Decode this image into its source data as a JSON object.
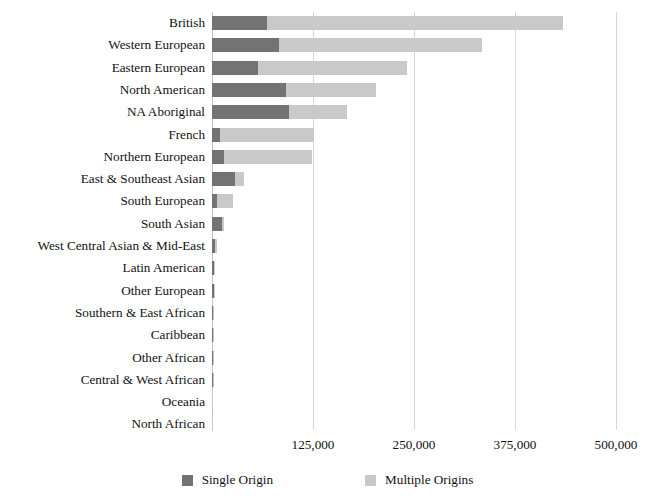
{
  "chart_data": {
    "type": "bar",
    "orientation": "horizontal",
    "stacked": true,
    "title": "",
    "subtitle": "",
    "xlabel": "",
    "ylabel": "",
    "xlim": [
      0,
      500000
    ],
    "xticks": [
      0,
      125000,
      250000,
      375000,
      500000
    ],
    "xtick_labels": [
      "",
      "125,000",
      "250,000",
      "375,000",
      "500,000"
    ],
    "grid": true,
    "legend_position": "bottom",
    "colors": {
      "single_origin": "#737373",
      "multiple_origins": "#c9c9c9",
      "gridline": "#d6d6d6",
      "background": "#ffffff",
      "text": "#111111"
    },
    "categories": [
      "British",
      "Western European",
      "Eastern European",
      "North American",
      "NA Aboriginal",
      "French",
      "Northern European",
      "East & Southeast Asian",
      "South European",
      "South Asian",
      "West Central Asian & Mid-East",
      "Latin American",
      "Other European",
      "Southern & East African",
      "Caribbean",
      "Other African",
      "Central & West African",
      "Oceania",
      "North African"
    ],
    "series": [
      {
        "name": "Single Origin",
        "color": "#737373",
        "values": [
          67500,
          83000,
          56500,
          92000,
          95000,
          9900,
          14500,
          28800,
          6200,
          12800,
          4100,
          3000,
          2200,
          1700,
          1500,
          1400,
          1000,
          400,
          300
        ]
      },
      {
        "name": "Multiple Origins",
        "color": "#c9c9c9",
        "values": [
          366500,
          251000,
          184500,
          111000,
          72000,
          116100,
          109500,
          10800,
          19400,
          1700,
          2100,
          1200,
          1400,
          700,
          900,
          500,
          600,
          400,
          200
        ]
      }
    ],
    "totals": [
      434000,
      334000,
      241000,
      203000,
      167000,
      126000,
      124000,
      39600,
      25600,
      14500,
      6200,
      4200,
      3600,
      2400,
      2400,
      1900,
      1600,
      800,
      500
    ]
  },
  "legend": {
    "items": [
      {
        "label": "Single Origin",
        "swatch": "single"
      },
      {
        "label": "Multiple Origins",
        "swatch": "multiple"
      }
    ]
  }
}
